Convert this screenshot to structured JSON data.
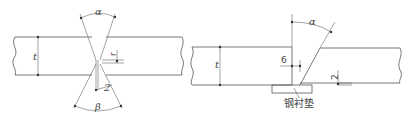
{
  "diagram": {
    "type": "welding-groove-detail",
    "colors": {
      "line": "#555555",
      "text": "#444444",
      "background": "#ffffff"
    },
    "left_figure": {
      "name": "double-v-groove-butt-joint",
      "labels": {
        "top_angle": "α",
        "bottom_angle": "β",
        "thickness": "t",
        "root_face": "r",
        "root_gap": "2"
      }
    },
    "right_figure": {
      "name": "single-bevel-groove-with-backing",
      "labels": {
        "bevel_angle": "α",
        "thickness": "t",
        "gap": "6",
        "offset": "2",
        "backing": "钢衬垫"
      }
    }
  }
}
